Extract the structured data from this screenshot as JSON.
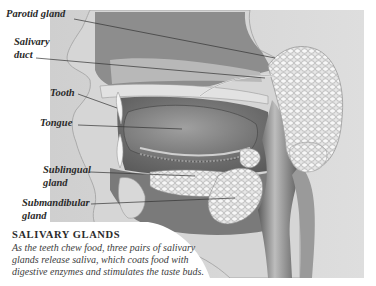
{
  "figure": {
    "type": "anatomical illustration"
  },
  "labels": [
    {
      "id": "parotid",
      "text": "Parotid gland"
    },
    {
      "id": "salivary_duct_1",
      "text": "Salivary"
    },
    {
      "id": "salivary_duct_2",
      "text": "duct"
    },
    {
      "id": "tooth",
      "text": "Tooth"
    },
    {
      "id": "tongue",
      "text": "Tongue"
    },
    {
      "id": "sublingual_1",
      "text": "Sublingual"
    },
    {
      "id": "sublingual_2",
      "text": "gland"
    },
    {
      "id": "submandibular_1",
      "text": "Submandibular"
    },
    {
      "id": "submandibular_2",
      "text": "gland"
    }
  ],
  "caption": {
    "title": "SALIVARY GLANDS",
    "body_lines": [
      "As the teeth chew food, three pairs of salivary",
      "glands release saliva, which coats food with",
      "digestive enzymes and stimulates the taste buds."
    ]
  },
  "colors": {
    "background": "#ffffff",
    "panel": "#d9d9d9",
    "skin": "#dcdcdc",
    "tissue_dark": "#6e6e6e",
    "gland": "#f0f0f0",
    "leader_line": "#333333"
  }
}
